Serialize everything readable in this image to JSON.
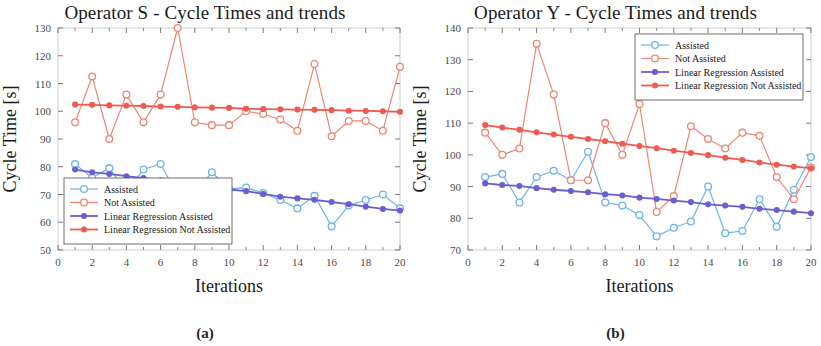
{
  "figure": {
    "panels": [
      {
        "id": "panel-a",
        "caption": "(a)",
        "title": "Operator S - Cycle Times and trends",
        "xlabel": "Iterations",
        "ylabel": "Cycle Time [s]",
        "legend_position": "bottom-left"
      },
      {
        "id": "panel-b",
        "caption": "(b)",
        "title": "Operator Y - Cycle Times and trends",
        "xlabel": "Iterations",
        "ylabel": "Cycle Time [s]",
        "legend_position": "top-right"
      }
    ],
    "legend_labels": [
      "Assisted",
      "Not Assisted",
      "Linear Regression Assisted",
      "Linear Regression Not Assisted"
    ],
    "colors": {
      "assisted": "#6cb4e8",
      "not_assisted": "#ed8572",
      "lin_reg_assisted": "#6a5fd0",
      "lin_reg_not_assisted": "#ef5a52",
      "axis": "#6b6b6b",
      "text": "#1a1a1a"
    }
  },
  "chart_data": [
    {
      "type": "line",
      "panel": "a",
      "title": "Operator S - Cycle Times and trends",
      "xlabel": "Iterations",
      "ylabel": "Cycle Time [s]",
      "xlim": [
        0,
        20
      ],
      "ylim": [
        50,
        130
      ],
      "xticks": [
        0,
        2,
        4,
        6,
        8,
        10,
        12,
        14,
        16,
        18,
        20
      ],
      "yticks": [
        50,
        60,
        70,
        80,
        90,
        100,
        110,
        120,
        130
      ],
      "grid": false,
      "legend_position": "bottom-left",
      "x": [
        1,
        2,
        3,
        4,
        5,
        6,
        7,
        8,
        9,
        10,
        11,
        12,
        13,
        14,
        15,
        16,
        17,
        18,
        19,
        20
      ],
      "series": [
        {
          "name": "Assisted",
          "color": "#6cb4e8",
          "marker": "open-circle",
          "values": [
            81,
            76,
            79.5,
            71,
            79,
            81,
            69.5,
            70.5,
            78,
            72,
            72.5,
            70.5,
            68,
            65,
            69.5,
            58.5,
            66,
            68,
            70,
            65
          ]
        },
        {
          "name": "Not Assisted",
          "color": "#ed8572",
          "marker": "open-circle",
          "values": [
            96,
            112.5,
            90,
            106,
            96,
            106,
            130,
            96,
            95,
            95,
            100,
            99,
            97,
            93,
            117,
            91,
            96.5,
            96.5,
            93,
            116
          ]
        },
        {
          "name": "Linear Regression Assisted",
          "color": "#6a5fd0",
          "marker": "filled-circle",
          "values": [
            79,
            78,
            77.4,
            76.6,
            75.9,
            75.1,
            74.4,
            73.1,
            72.6,
            71.8,
            71.2,
            70.2,
            69.2,
            68.6,
            68.1,
            67.3,
            66.5,
            65.6,
            64.8,
            64.2
          ]
        },
        {
          "name": "Linear Regression Not Assisted",
          "color": "#ef5a52",
          "marker": "filled-circle",
          "values": [
            102.4,
            102.3,
            102.1,
            102,
            101.9,
            101.7,
            101.6,
            101.4,
            101.3,
            101.2,
            100.9,
            100.8,
            100.7,
            100.6,
            100.5,
            100.4,
            100.2,
            100.1,
            100,
            99.8
          ]
        }
      ]
    },
    {
      "type": "line",
      "panel": "b",
      "title": "Operator Y - Cycle Times and trends",
      "xlabel": "Iterations",
      "ylabel": "Cycle Time [s]",
      "xlim": [
        0,
        20
      ],
      "ylim": [
        70,
        140
      ],
      "xticks": [
        0,
        2,
        4,
        6,
        8,
        10,
        12,
        14,
        16,
        18,
        20
      ],
      "yticks": [
        70,
        80,
        90,
        100,
        110,
        120,
        130,
        140
      ],
      "grid": false,
      "legend_position": "top-right",
      "x": [
        1,
        2,
        3,
        4,
        5,
        6,
        7,
        8,
        9,
        10,
        11,
        12,
        13,
        14,
        15,
        16,
        17,
        18,
        19,
        20
      ],
      "series": [
        {
          "name": "Assisted",
          "color": "#6cb4e8",
          "marker": "open-circle",
          "values": [
            93,
            94,
            85,
            93,
            95,
            92,
            101,
            85,
            84,
            81,
            74.3,
            77,
            79,
            90,
            75.3,
            76,
            86,
            77.3,
            89,
            99.3
          ]
        },
        {
          "name": "Not Assisted",
          "color": "#ed8572",
          "marker": "open-circle",
          "values": [
            107,
            100,
            102,
            135,
            119,
            92,
            92,
            110,
            100,
            116,
            82,
            87,
            109,
            105,
            102,
            107,
            106,
            93,
            86,
            96
          ]
        },
        {
          "name": "Linear Regression Assisted",
          "color": "#6a5fd0",
          "marker": "filled-circle",
          "values": [
            91,
            90.5,
            90.2,
            89.5,
            89,
            88.6,
            88.2,
            87.6,
            87.2,
            86.5,
            86.1,
            85.6,
            85.1,
            84.4,
            84,
            83.6,
            83,
            82.6,
            82.1,
            81.6
          ]
        },
        {
          "name": "Linear Regression Not Assisted",
          "color": "#ef5a52",
          "marker": "filled-circle",
          "values": [
            109.4,
            108.6,
            107.9,
            107.1,
            106.4,
            105.7,
            105,
            104.3,
            103.5,
            102.8,
            102.1,
            101.3,
            100.6,
            99.9,
            99.1,
            98.4,
            97.6,
            96.9,
            96.3,
            95.8
          ]
        }
      ]
    }
  ]
}
